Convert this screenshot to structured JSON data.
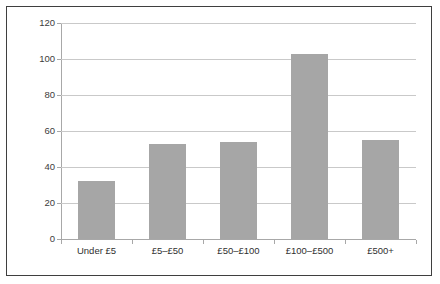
{
  "chart_data": {
    "type": "bar",
    "title": "",
    "subtitle": "",
    "xlabel": "",
    "ylabel": "",
    "categories": [
      "Under £5",
      "£5–£50",
      "£50–£100",
      "£100–£500",
      "£500+"
    ],
    "values": [
      32,
      53,
      54,
      103,
      55
    ],
    "ylim": [
      0,
      120
    ],
    "ytick_labels": [
      "0",
      "20",
      "40",
      "60",
      "80",
      "100",
      "120"
    ],
    "ytick_values": [
      0,
      20,
      40,
      60,
      80,
      100,
      120
    ],
    "grid": true,
    "grid_axis": "y",
    "legend": "none",
    "bar_color": "#a6a6a6",
    "gridline_color": "#c9c9c9",
    "axis_color": "#a8a8a8",
    "plot_background": "#ffffff",
    "frame_border_color": "#3f3f3f",
    "text_color": "#2f2f2f"
  }
}
